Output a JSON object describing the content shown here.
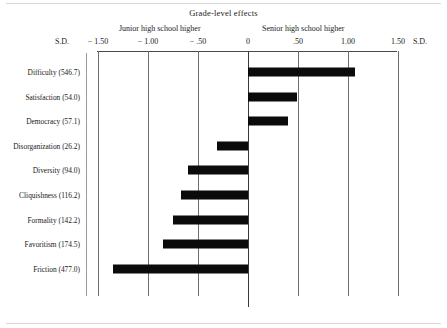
{
  "chart_data": {
    "type": "bar",
    "orientation": "horizontal",
    "title": "Grade-level effects",
    "xlabel": "S.D.",
    "ylabel": "",
    "xlim": [
      -1.75,
      1.75
    ],
    "grid": true,
    "legend": "none",
    "axis_unit_left": "S.D.",
    "axis_unit_right": "S.D.",
    "side_caption_left": "Junior high school higher",
    "side_caption_right": "Senior high school higher",
    "tick_values": [
      -1.5,
      -1.0,
      -0.5,
      0,
      0.5,
      1.0,
      1.5
    ],
    "tick_labels": [
      "− 1.50",
      "− 1.00",
      "− .50",
      "0",
      ".50",
      "1.00",
      "1.50"
    ],
    "categories": [
      "Difficulty (546.7)",
      "Satisfaction (54.0)",
      "Democracy (57.1)",
      "Disorganization (26.2)",
      "Diversity (94.0)",
      "Cliquishness (116.2)",
      "Formality (142.2)",
      "Favoritism (174.5)",
      "Friction (477.0)"
    ],
    "category_names": [
      "Difficulty",
      "Satisfaction",
      "Democracy",
      "Disorganization",
      "Diversity",
      "Cliquishness",
      "Formality",
      "Favoritism",
      "Friction"
    ],
    "category_statistics": [
      546.7,
      54.0,
      57.1,
      26.2,
      94.0,
      116.2,
      142.2,
      174.5,
      477.0
    ],
    "values": [
      1.07,
      0.49,
      0.4,
      -0.31,
      -0.6,
      -0.67,
      -0.75,
      -0.85,
      -1.35
    ],
    "bar_color": "#0b0b0b",
    "axis_color": "#4a4a4a",
    "gridline_color": "#6f6f6f",
    "background_color": "#ffffff"
  }
}
